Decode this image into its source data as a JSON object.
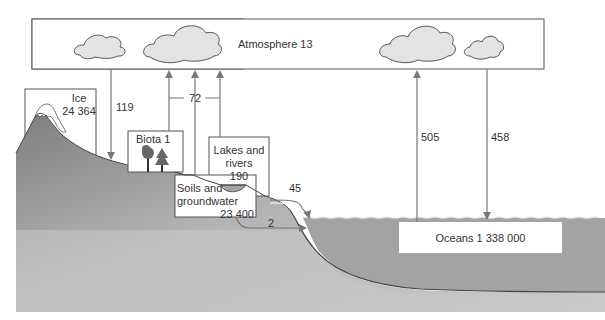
{
  "diagram": {
    "colors": {
      "land_dark": "#8e8e8e",
      "land_light": "#c6c6c6",
      "ocean": "#a3a3a3",
      "cloud_fill": "#e3e3e3",
      "line": "#555555",
      "arrow": "#777777",
      "text": "#333333"
    },
    "reservoirs": {
      "atmosphere": {
        "label": "Atmosphere 13",
        "name": "Atmosphere",
        "value": 13
      },
      "ice": {
        "line1": "Ice",
        "line2": "24 364",
        "name": "Ice",
        "value": 24364
      },
      "biota": {
        "label": "Biota 1",
        "name": "Biota",
        "value": 1
      },
      "lakes": {
        "line1": "Lakes and",
        "line2": "rivers",
        "line3": "190",
        "name": "Lakes and rivers",
        "value": 190
      },
      "soils": {
        "line1": "Soils and",
        "line2": "groundwater",
        "line3": "23 400",
        "name": "Soils and groundwater",
        "value": 23400
      },
      "oceans": {
        "label": "Oceans 1 338 000",
        "name": "Oceans",
        "value": 1338000
      }
    },
    "fluxes": {
      "precip_land": {
        "label": "119",
        "from": "Atmosphere",
        "to": "Land"
      },
      "evapotranspiration": {
        "label": "72",
        "from": "Land",
        "to": "Atmosphere"
      },
      "evap_ocean": {
        "label": "505",
        "from": "Oceans",
        "to": "Atmosphere"
      },
      "precip_ocean": {
        "label": "458",
        "from": "Atmosphere",
        "to": "Oceans"
      },
      "runoff": {
        "label": "45",
        "from": "Lakes and rivers",
        "to": "Oceans"
      },
      "groundwater_flow": {
        "label": "2",
        "from": "Soils and groundwater",
        "to": "Oceans"
      }
    }
  }
}
